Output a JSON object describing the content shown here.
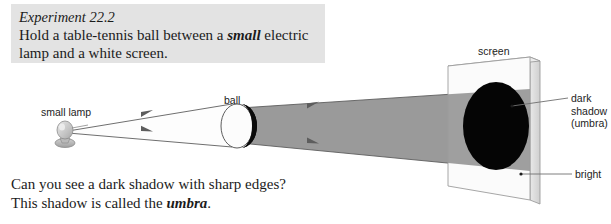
{
  "figure": {
    "instruction": {
      "experiment_title": "Experiment 22.2",
      "line1_part1": "Hold a table-tennis ball between a ",
      "line1_bold": "small",
      "line1_part2": " electric",
      "line2": "lamp and a white screen.",
      "background_color": "#e3e3e3"
    },
    "question": {
      "line1": "Can you see a dark shadow with sharp edges?",
      "line2_part1": "This shadow is called the ",
      "line2_bold": "umbra",
      "line2_part2": "."
    },
    "labels": {
      "small_lamp": "small lamp",
      "ball": "ball",
      "screen": "screen",
      "dark_shadow_line1": "dark",
      "dark_shadow_line2": "shadow",
      "dark_shadow_line3": "(umbra)",
      "bright": "bright"
    },
    "colors": {
      "shadow_beam": "#9a9a9a",
      "umbra_disc": "#000000",
      "screen_face": "#fbfbfb",
      "screen_edge": "#d7d7d7",
      "light_cone": "#fdfdfd",
      "ray_stroke": "#6f6f6f",
      "outline": "#545454",
      "lamp_bulb": "#c9c9c9",
      "text": "#1b1b1b"
    }
  }
}
